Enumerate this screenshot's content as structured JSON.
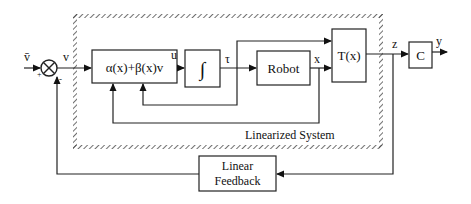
{
  "diagram": {
    "signals": {
      "vbar": "v̄",
      "v": "v",
      "u": "u",
      "tau": "τ",
      "x": "x",
      "z": "z",
      "y": "y",
      "plus": "+",
      "minus": "-"
    },
    "blocks": {
      "control_law": "α(x)+β(x)v",
      "integrator": "∫",
      "robot": "Robot",
      "transform": "T(x)",
      "output": "C",
      "feedback_line1": "Linear",
      "feedback_line2": "Feedback"
    },
    "region_label": "Linearized System",
    "colors": {
      "line": "#222222",
      "background": "#ffffff"
    }
  }
}
